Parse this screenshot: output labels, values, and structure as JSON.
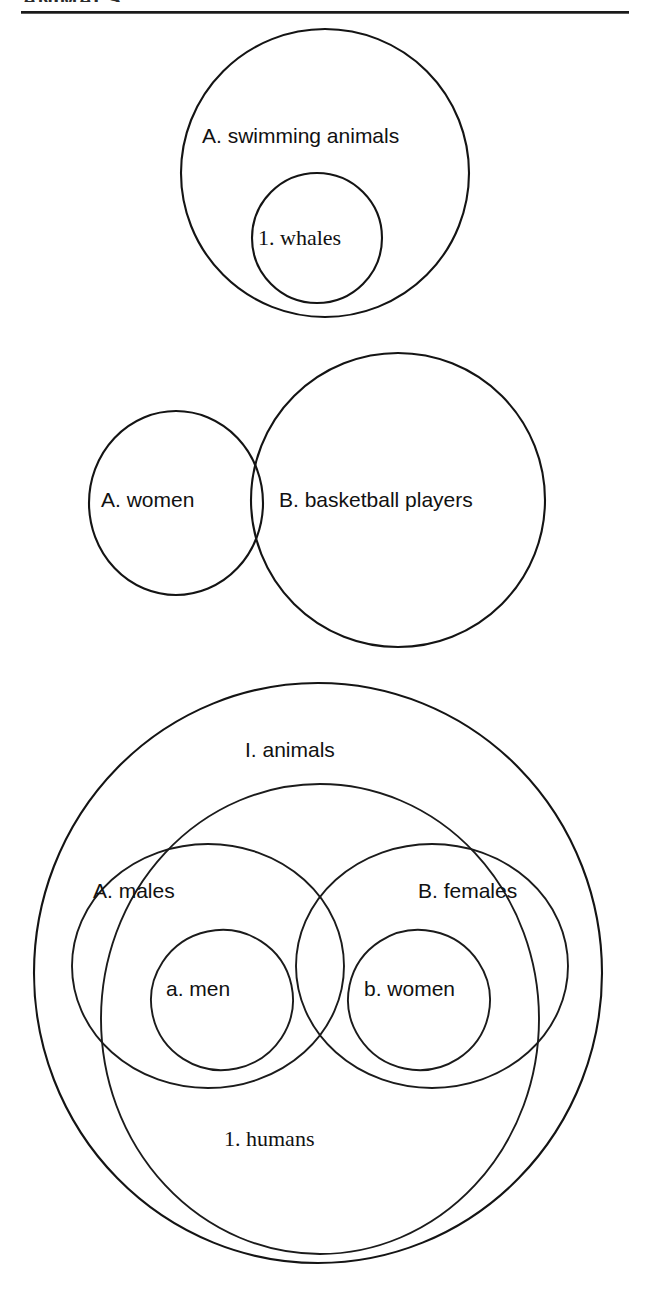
{
  "page": {
    "running_head": "ANIMALS.",
    "background_color": "#ffffff",
    "ink_color": "#141414"
  },
  "figures": [
    {
      "id": "figure-1",
      "type": "euler-nested",
      "labels": {
        "outer": "A.  swimming animals",
        "inner": "1.  whales"
      }
    },
    {
      "id": "figure-2",
      "type": "euler-overlapping",
      "labels": {
        "left": "A.  women",
        "right": "B.  basketball players"
      }
    },
    {
      "id": "figure-3",
      "type": "euler-nested-overlapping",
      "labels": {
        "universe": "I.  animals",
        "left_group": "A.  males",
        "right_group": "B.  females",
        "left_inner": "a.  men",
        "right_inner": "b.  women",
        "subset": "1.  humans"
      }
    }
  ],
  "diagram_shapes": {
    "figure1": [
      {
        "name": "swimming-animals-circle",
        "cx": 325,
        "cy": 173,
        "rx": 144,
        "ry": 144
      },
      {
        "name": "whales-circle",
        "cx": 317,
        "cy": 238,
        "rx": 65,
        "ry": 65
      }
    ],
    "figure2": [
      {
        "name": "women-circle",
        "cx": 176,
        "cy": 503,
        "rx": 87,
        "ry": 92
      },
      {
        "name": "basketball-players-circle",
        "cx": 398,
        "cy": 500,
        "rx": 147,
        "ry": 147
      }
    ],
    "figure3": [
      {
        "name": "animals-circle",
        "cx": 318,
        "cy": 973,
        "rx": 284,
        "ry": 290
      },
      {
        "name": "males-ellipse",
        "cx": 208,
        "cy": 966,
        "rx": 136,
        "ry": 122
      },
      {
        "name": "females-ellipse",
        "cx": 432,
        "cy": 966,
        "rx": 136,
        "ry": 122
      },
      {
        "name": "humans-ellipse",
        "cx": 320,
        "cy": 1019,
        "rx": 219,
        "ry": 235
      },
      {
        "name": "men-ellipse",
        "cx": 222,
        "cy": 1000,
        "rx": 71,
        "ry": 70
      },
      {
        "name": "women-ellipse",
        "cx": 419,
        "cy": 1000,
        "rx": 71,
        "ry": 70
      }
    ]
  }
}
